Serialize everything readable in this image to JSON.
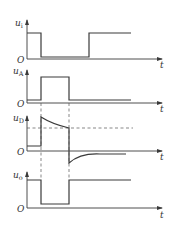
{
  "diagram": {
    "colors": {
      "line": "#3a3a3a",
      "background": "#ffffff"
    },
    "time_axis_label": "t",
    "origin_label": "O",
    "plots": [
      {
        "id": "ui",
        "symbol": "u",
        "subscript": "i",
        "shape": "high, drops to low at t1, returns high at t3"
      },
      {
        "id": "uA",
        "symbol": "u",
        "subscript": "A",
        "shape": "low, pulse high from t1 to t2"
      },
      {
        "id": "uD",
        "symbol": "u",
        "subscript": "D",
        "shape": "small positive level, jumps up at t1 and decays toward dashed threshold, drops negative at t2 and decays to zero"
      },
      {
        "id": "uo",
        "symbol": "u",
        "subscript": "o",
        "shape": "high, drops low from t1 to t2, then high"
      }
    ],
    "markers": {
      "vertical_dashed_lines": 2,
      "horizontal_dashed_threshold": "on uD plot"
    }
  }
}
